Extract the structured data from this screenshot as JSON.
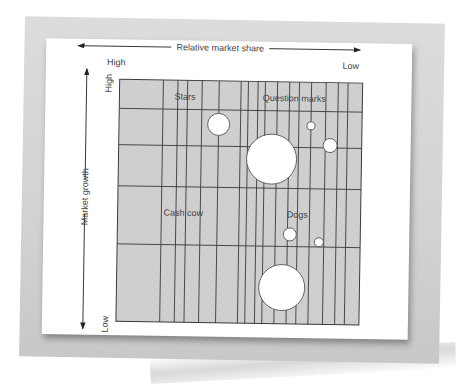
{
  "chart_data": {
    "type": "scatter",
    "subtype": "bubble-matrix (BCG growth-share matrix)",
    "title": "",
    "xlabel": "Relative market share",
    "ylabel": "Market growth",
    "x_axis": {
      "left_label": "High",
      "right_label": "Low",
      "direction": "high-to-low"
    },
    "y_axis": {
      "top_label": "High",
      "bottom_label": "Low"
    },
    "grid": true,
    "colors": {
      "grid_fill": "#cfcfcf",
      "grid_line": "#3a3a3a",
      "bubble_fill": "#ffffff",
      "bubble_stroke": "#555555"
    },
    "quadrant_labels": [
      {
        "text": "Stars",
        "x": 0.27,
        "y": 0.92
      },
      {
        "text": "Question marks",
        "x": 0.72,
        "y": 0.92
      },
      {
        "text": "Cash cow",
        "x": 0.27,
        "y": 0.44
      },
      {
        "text": "Dogs",
        "x": 0.74,
        "y": 0.44
      }
    ],
    "vertical_gridlines_x": [
      0.18,
      0.24,
      0.28,
      0.34,
      0.41,
      0.5,
      0.53,
      0.57,
      0.6,
      0.65,
      0.7,
      0.74,
      0.79,
      0.85,
      0.9,
      0.94
    ],
    "horizontal_gridlines_y": [
      0.88,
      0.73,
      0.56,
      0.32
    ],
    "bubbles": [
      {
        "x": 0.41,
        "y": 0.82,
        "r": 11
      },
      {
        "x": 0.63,
        "y": 0.68,
        "r": 25
      },
      {
        "x": 0.79,
        "y": 0.82,
        "r": 4
      },
      {
        "x": 0.87,
        "y": 0.74,
        "r": 7
      },
      {
        "x": 0.71,
        "y": 0.37,
        "r": 6.5
      },
      {
        "x": 0.83,
        "y": 0.34,
        "r": 4.5
      },
      {
        "x": 0.68,
        "y": 0.15,
        "r": 23
      }
    ]
  }
}
